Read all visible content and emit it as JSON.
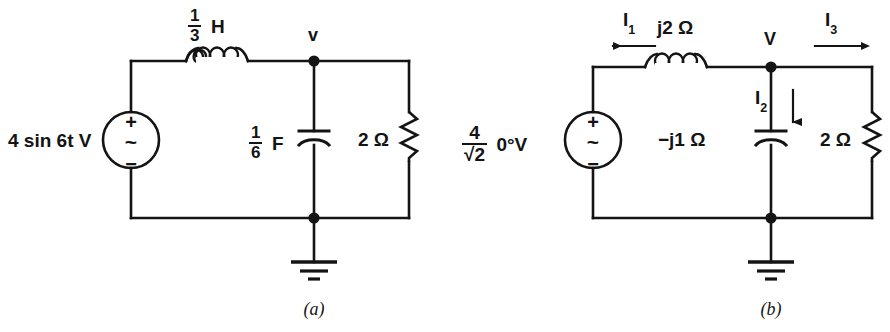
{
  "figure": {
    "ink_color": "#141414",
    "background_color": "#ffffff"
  },
  "circuit_a": {
    "caption": "(a)",
    "source": {
      "label": "4 sin 6t V",
      "plus_symbol": "+",
      "wave_symbol": "~",
      "minus_symbol": "−",
      "type": "ac-voltage-source"
    },
    "inductor": {
      "numerator": "1",
      "denominator": "3",
      "unit": "H",
      "coils": 3
    },
    "capacitor": {
      "numerator": "1",
      "denominator": "6",
      "unit": "F"
    },
    "resistor": {
      "label": "2 Ω"
    },
    "node_label": "v",
    "ground": "earth-ground"
  },
  "circuit_b": {
    "caption": "(b)",
    "source": {
      "numerator": "4",
      "denominator": "√2",
      "angle": "0°V",
      "plus_symbol": "+",
      "wave_symbol": "~",
      "minus_symbol": "−",
      "type": "ac-voltage-source"
    },
    "inductor": {
      "label": "j2 Ω",
      "coils": 3
    },
    "capacitor": {
      "label": "−j1 Ω"
    },
    "resistor": {
      "label": "2 Ω"
    },
    "node_label": "V",
    "ground": "earth-ground",
    "currents": [
      {
        "name": "I1",
        "symbol": "I",
        "subscript": "1",
        "direction": "left"
      },
      {
        "name": "I2",
        "symbol": "I",
        "subscript": "2",
        "direction": "down"
      },
      {
        "name": "I3",
        "symbol": "I",
        "subscript": "3",
        "direction": "right"
      }
    ]
  }
}
